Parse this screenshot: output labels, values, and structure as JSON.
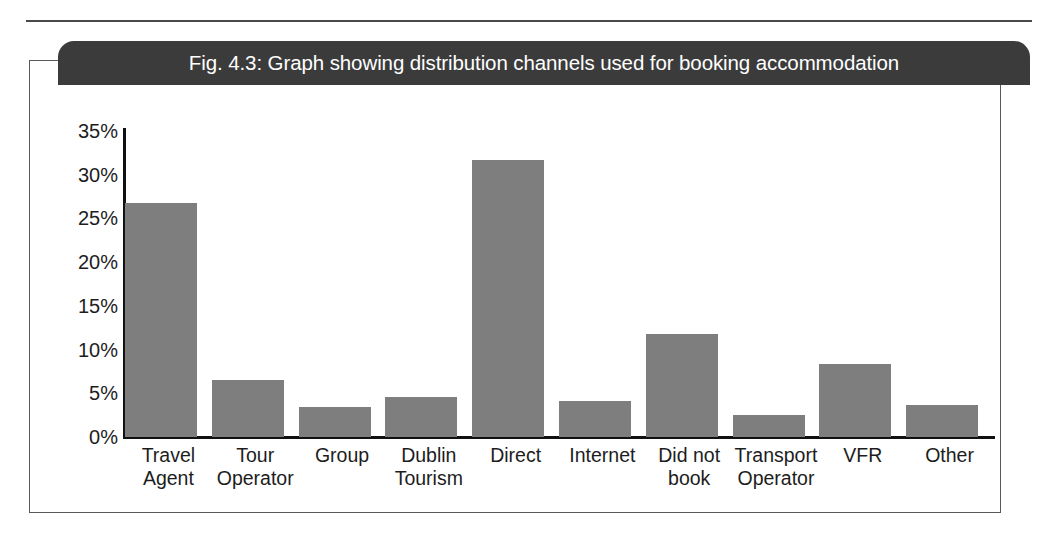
{
  "figure": {
    "caption": "Fig. 4.3: Graph showing distribution channels used for booking accommodation",
    "frame_color": "#595959",
    "caption_bar_color": "#3b3b3b",
    "caption_text_color": "#ffffff"
  },
  "chart_data": {
    "type": "bar",
    "title": "Fig. 4.3: Graph showing distribution channels used for booking accommodation",
    "xlabel": "",
    "ylabel": "",
    "categories": [
      "Travel Agent",
      "Tour Operator",
      "Group",
      "Dublin Tourism",
      "Direct",
      "Internet",
      "Did not book",
      "Transport Operator",
      "VFR",
      "Other"
    ],
    "category_lines": [
      [
        "Travel",
        "Agent"
      ],
      [
        "Tour",
        "Operator"
      ],
      [
        "Group"
      ],
      [
        "Dublin",
        "Tourism"
      ],
      [
        "Direct"
      ],
      [
        "Internet"
      ],
      [
        "Did not",
        "book"
      ],
      [
        "Transport",
        "Operator"
      ],
      [
        "VFR"
      ],
      [
        "Other"
      ]
    ],
    "values": [
      26.7,
      6.5,
      3.4,
      4.6,
      31.6,
      4.1,
      11.7,
      2.5,
      8.3,
      3.7
    ],
    "value_unit": "%",
    "ylim": [
      0,
      35
    ],
    "ytick_values": [
      35,
      30,
      25,
      20,
      15,
      10,
      5,
      0
    ],
    "ytick_labels": [
      "35%",
      "30%",
      "25%",
      "20%",
      "15%",
      "10%",
      "5%",
      "0%"
    ],
    "grid": false,
    "legend": null,
    "bar_color": "#7e7e7e",
    "axis_color": "#111111"
  }
}
